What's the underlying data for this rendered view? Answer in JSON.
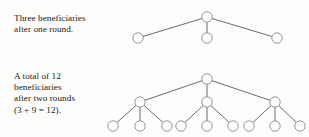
{
  "page": {
    "background_color": "#fdfdfc",
    "width": 309,
    "height": 137
  },
  "captions": {
    "round_one": "Three beneficiaries\nafter one round.",
    "round_two": "A total of 12\nbeneficiaries\nafter two rounds\n(3 + 9 = 12)."
  },
  "diagram_style": {
    "node_stroke_color": "#8a8a8a",
    "node_fill_color": "#ffffff",
    "edge_color": "#5a5a5a",
    "node_radius": 5.2,
    "node_stroke_width": 0.9,
    "edge_stroke_width": 0.9
  },
  "diagrams": [
    {
      "id": "tree-one-round",
      "name": "one-round-tree",
      "levels": 2,
      "node_count": 4,
      "beneficiary_count": 3,
      "nodes": [
        {
          "id": "r",
          "x": 207,
          "y": 17,
          "level": 0
        },
        {
          "id": "a",
          "x": 138,
          "y": 38,
          "level": 1
        },
        {
          "id": "b",
          "x": 207,
          "y": 38,
          "level": 1
        },
        {
          "id": "c",
          "x": 277,
          "y": 38,
          "level": 1
        }
      ],
      "edges": [
        {
          "from": "r",
          "to": "a"
        },
        {
          "from": "r",
          "to": "b"
        },
        {
          "from": "r",
          "to": "c"
        }
      ]
    },
    {
      "id": "tree-two-rounds",
      "name": "two-round-tree",
      "levels": 3,
      "node_count": 13,
      "beneficiary_count": 12,
      "nodes": [
        {
          "id": "r",
          "x": 207,
          "y": 79,
          "level": 0
        },
        {
          "id": "n1",
          "x": 140,
          "y": 102,
          "level": 1
        },
        {
          "id": "n2",
          "x": 207,
          "y": 102,
          "level": 1
        },
        {
          "id": "n3",
          "x": 275,
          "y": 102,
          "level": 1
        },
        {
          "id": "l1",
          "x": 113,
          "y": 126,
          "level": 2
        },
        {
          "id": "l2",
          "x": 140,
          "y": 126,
          "level": 2
        },
        {
          "id": "l3",
          "x": 167,
          "y": 126,
          "level": 2
        },
        {
          "id": "l4",
          "x": 181,
          "y": 126,
          "level": 2
        },
        {
          "id": "l5",
          "x": 207,
          "y": 126,
          "level": 2
        },
        {
          "id": "l6",
          "x": 233,
          "y": 126,
          "level": 2
        },
        {
          "id": "l7",
          "x": 249,
          "y": 126,
          "level": 2
        },
        {
          "id": "l8",
          "x": 275,
          "y": 126,
          "level": 2
        },
        {
          "id": "l9",
          "x": 300,
          "y": 126,
          "level": 2
        }
      ],
      "edges": [
        {
          "from": "r",
          "to": "n1"
        },
        {
          "from": "r",
          "to": "n2"
        },
        {
          "from": "r",
          "to": "n3"
        },
        {
          "from": "n1",
          "to": "l1"
        },
        {
          "from": "n1",
          "to": "l2"
        },
        {
          "from": "n1",
          "to": "l3"
        },
        {
          "from": "n2",
          "to": "l4"
        },
        {
          "from": "n2",
          "to": "l5"
        },
        {
          "from": "n2",
          "to": "l6"
        },
        {
          "from": "n3",
          "to": "l7"
        },
        {
          "from": "n3",
          "to": "l8"
        },
        {
          "from": "n3",
          "to": "l9"
        }
      ]
    }
  ]
}
